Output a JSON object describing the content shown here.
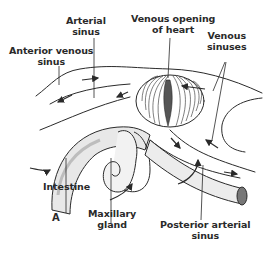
{
  "figure": {
    "panel_letter": "A",
    "labels": {
      "arterial_sinus": [
        "Arterial",
        "sinus"
      ],
      "venous_opening": [
        "Venous opening",
        "of heart"
      ],
      "anterior_venous_sinus": [
        "Anterior venous",
        "sinus"
      ],
      "venous_sinuses": [
        "Venous",
        "sinuses"
      ],
      "intestine": [
        "Intestine"
      ],
      "maxillary_gland": [
        "Maxillary",
        "gland"
      ],
      "posterior_arterial_sinus": [
        "Posterior arterial",
        "sinus"
      ]
    },
    "colors": {
      "ink": "#2a2a2a",
      "background": "#ffffff",
      "shading": "#bdbdbd"
    }
  }
}
